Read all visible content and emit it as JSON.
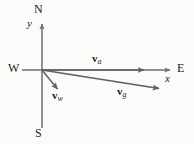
{
  "figure": {
    "type": "vector-diagram",
    "background_color": "#fbfbf9",
    "line_color": "#6e6e6e",
    "text_color": "#1b1b1b"
  },
  "compass": {
    "north_label": "N",
    "south_label": "S",
    "west_label": "W",
    "east_label": "E"
  },
  "axes": {
    "x_label": "x",
    "y_label": "y",
    "origin": {
      "x": 42,
      "y": 70
    },
    "x_axis": {
      "start_x": 22,
      "end_x": 172,
      "y": 70
    },
    "y_axis": {
      "x": 42,
      "start_y": 128,
      "end_y": 22
    }
  },
  "vectors": [
    {
      "id": "v-a",
      "symbol": "v",
      "subscript": "a",
      "from": {
        "x": 42,
        "y": 70
      },
      "to": {
        "x": 147,
        "y": 70
      },
      "direction_note": "due east along +x"
    },
    {
      "id": "v-w",
      "symbol": "v",
      "subscript": "w",
      "from": {
        "x": 42,
        "y": 70
      },
      "to": {
        "x": 60,
        "y": 92
      },
      "direction_note": "southeast, short"
    },
    {
      "id": "v-g",
      "symbol": "v",
      "subscript": "g",
      "from": {
        "x": 42,
        "y": 70
      },
      "to": {
        "x": 162,
        "y": 89
      },
      "direction_note": "east, slightly south"
    }
  ]
}
